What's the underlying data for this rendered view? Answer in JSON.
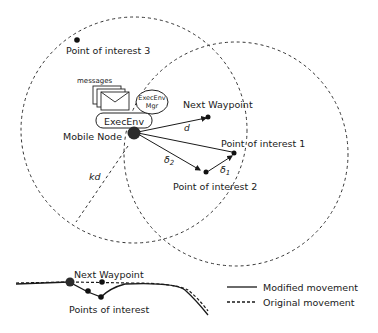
{
  "colors": {
    "ink": "#1a1a1a",
    "node": "#2b2b2b",
    "background": "#ffffff"
  },
  "labels": {
    "poi3": "Point of interest 3",
    "messages": "messages",
    "execenv_mgr_line1": "ExecEnv",
    "execenv_mgr_line2": "Mgr",
    "execenv": "ExecEnv",
    "mobile_node": "Mobile Node",
    "next_waypoint": "Next Waypoint",
    "d": "d",
    "poi1": "Point of interest 1",
    "delta2": "δ",
    "delta2_sub": "2",
    "delta1": "δ",
    "delta1_sub": "1",
    "poi2": "Point of interest 2",
    "kd": "kd"
  },
  "bottom": {
    "next_waypoint": "Next Waypoint",
    "points_of_interest": "Points of interest"
  },
  "legend": {
    "items": [
      {
        "label": "Modified movement",
        "style": "solid"
      },
      {
        "label": "Original movement",
        "style": "dashed"
      }
    ]
  }
}
